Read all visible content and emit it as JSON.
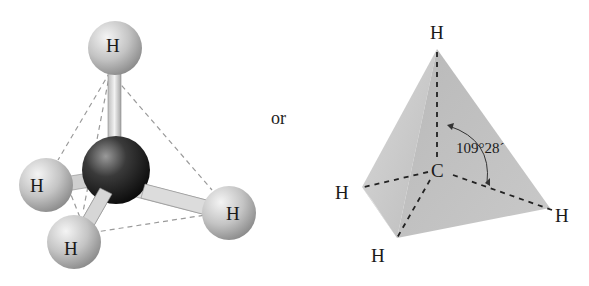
{
  "left_model": {
    "type": "ball-and-stick",
    "central_atom": "C",
    "atoms": [
      {
        "label": "H",
        "position": "top"
      },
      {
        "label": "H",
        "position": "left"
      },
      {
        "label": "H",
        "position": "bottom-left"
      },
      {
        "label": "H",
        "position": "right"
      }
    ]
  },
  "connector_text": "or",
  "right_model": {
    "type": "tetrahedron",
    "center_label": "C",
    "vertices": [
      {
        "label": "H",
        "position": "top"
      },
      {
        "label": "H",
        "position": "left"
      },
      {
        "label": "H",
        "position": "bottom"
      },
      {
        "label": "H",
        "position": "right"
      }
    ],
    "bond_angle": "109°28´"
  },
  "colors": {
    "hydrogen": "#c8c8c8",
    "carbon": "#1e1e1e",
    "tetra_face": "#bdbdbd",
    "dash": "#9a9a9a"
  }
}
